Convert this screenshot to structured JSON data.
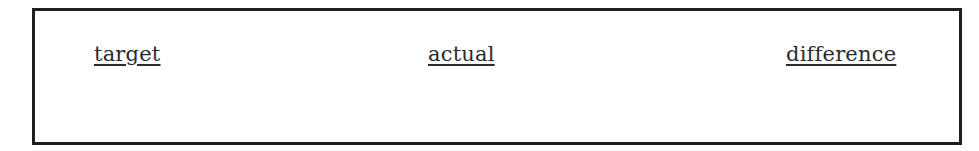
{
  "panel": {
    "labels": [
      {
        "id": "target",
        "text": "target"
      },
      {
        "id": "actual",
        "text": "actual"
      },
      {
        "id": "difference",
        "text": "difference"
      }
    ]
  },
  "colors": {
    "border": "#1f1f1f",
    "text": "#2b2b2b",
    "background": "#ffffff"
  }
}
